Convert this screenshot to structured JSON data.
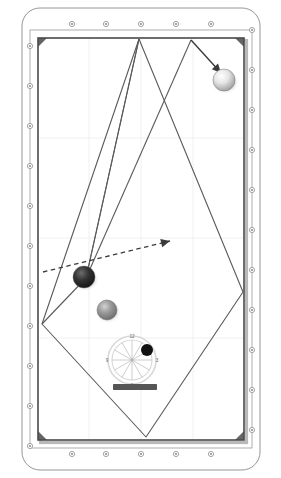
{
  "diagram": {
    "view": "top-down",
    "orientation": "portrait"
  },
  "colors": {
    "table_felt": "#ffffff",
    "rail_fill": "#ffffff",
    "rail_stroke": "#8a8a8a",
    "cushion_stroke": "#4a4a4a",
    "cushion_shadow": "#b9b9b9",
    "grid": "#f0f0f0",
    "trajectory": "#5a5a5a",
    "arrow": "#3b3b3b",
    "ball_object": "#2e2e2e",
    "ball_grey": "#8e8e8e",
    "ball_cue": "#dcdcdc",
    "dial_ring": "#d8d8d8",
    "dial_spoke": "#c8c8c8",
    "dial_dot": "#111111",
    "tip_bar": "#555555",
    "label_text": "#666666"
  },
  "table": {
    "outer_frame": {
      "x": 22,
      "y": 8,
      "width": 238,
      "height": 462,
      "corner_radius": 18
    },
    "playfield": {
      "x": 38,
      "y": 38,
      "width": 206,
      "height": 402
    },
    "rail_width": 16,
    "diamond_marker": {
      "shape": "small-circle",
      "radius": 2.6,
      "stroke": "#9a9a9a"
    },
    "diamonds": {
      "top": [
        {
          "x": 72,
          "y": 24
        },
        {
          "x": 106,
          "y": 24
        },
        {
          "x": 141,
          "y": 24
        },
        {
          "x": 176,
          "y": 24
        },
        {
          "x": 211,
          "y": 24
        }
      ],
      "bottom": [
        {
          "x": 72,
          "y": 454
        },
        {
          "x": 106,
          "y": 454
        },
        {
          "x": 141,
          "y": 454
        },
        {
          "x": 176,
          "y": 454
        },
        {
          "x": 211,
          "y": 454
        }
      ],
      "left": [
        {
          "x": 30,
          "y": 46
        },
        {
          "x": 30,
          "y": 86
        },
        {
          "x": 30,
          "y": 126
        },
        {
          "x": 30,
          "y": 166
        },
        {
          "x": 30,
          "y": 206
        },
        {
          "x": 30,
          "y": 246
        },
        {
          "x": 30,
          "y": 286
        },
        {
          "x": 30,
          "y": 326
        },
        {
          "x": 30,
          "y": 366
        },
        {
          "x": 30,
          "y": 406
        },
        {
          "x": 30,
          "y": 446
        }
      ],
      "right": [
        {
          "x": 252,
          "y": 30
        },
        {
          "x": 252,
          "y": 70
        },
        {
          "x": 252,
          "y": 110
        },
        {
          "x": 252,
          "y": 150
        },
        {
          "x": 252,
          "y": 190
        },
        {
          "x": 252,
          "y": 230
        },
        {
          "x": 252,
          "y": 270
        },
        {
          "x": 252,
          "y": 310
        },
        {
          "x": 252,
          "y": 350
        },
        {
          "x": 252,
          "y": 390
        },
        {
          "x": 252,
          "y": 430
        }
      ]
    },
    "grid_lines": {
      "vertical_x": [
        89,
        141,
        193
      ],
      "horizontal_y": [
        138,
        238,
        338
      ],
      "visible": true
    }
  },
  "balls": [
    {
      "name": "cue-ball",
      "label": "cue",
      "x": 224,
      "y": 80,
      "radius": 11,
      "color": "#dcdcdc",
      "kind": "cue"
    },
    {
      "name": "object-ball",
      "label": "object",
      "x": 84,
      "y": 277,
      "radius": 11,
      "color": "#2e2e2e",
      "kind": "object"
    },
    {
      "name": "secondary-ball",
      "label": "secondary",
      "x": 107,
      "y": 310,
      "radius": 10,
      "color": "#8e8e8e",
      "kind": "target"
    }
  ],
  "trajectories": [
    {
      "name": "path-segment-a",
      "points": [
        [
          139,
          39
        ],
        [
          86,
          278
        ]
      ],
      "style": "solid"
    },
    {
      "name": "path-segment-b",
      "points": [
        [
          86,
          278
        ],
        [
          139,
          39
        ]
      ],
      "style": "solid"
    },
    {
      "name": "kite-outline",
      "points": [
        [
          139,
          39
        ],
        [
          243,
          292
        ],
        [
          146,
          437
        ],
        [
          42,
          324
        ],
        [
          139,
          39
        ]
      ],
      "style": "solid"
    },
    {
      "name": "rebound-line",
      "points": [
        [
          191,
          40
        ],
        [
          86,
          278
        ]
      ],
      "style": "solid"
    },
    {
      "name": "rebound-line-2",
      "points": [
        [
          86,
          278
        ],
        [
          42,
          324
        ]
      ],
      "style": "solid"
    }
  ],
  "arrows": [
    {
      "name": "impact-arrow",
      "style": "solid",
      "from": [
        191,
        40
      ],
      "to": [
        221,
        73
      ],
      "label": "cue ball direction"
    },
    {
      "name": "aim-arrow",
      "style": "dashed",
      "from": [
        43,
        272
      ],
      "to": [
        170,
        241
      ],
      "label": "aim line"
    }
  ],
  "spin_dial": {
    "name": "english-dial",
    "center_x": 132,
    "center_y": 360,
    "outer_radius": 24,
    "inner_radius": 20,
    "spokes": 12,
    "hour_labels": [
      {
        "text": "12",
        "position": "top"
      },
      {
        "text": "3",
        "position": "right"
      },
      {
        "text": "6",
        "position": "bottom"
      },
      {
        "text": "9",
        "position": "left"
      }
    ],
    "contact_dot": {
      "x": 147,
      "y": 350,
      "radius": 6,
      "color": "#111111",
      "meaning": "tip contact point"
    },
    "tip_bar": {
      "x": 113,
      "y": 384,
      "width": 44,
      "height": 6,
      "color": "#555555",
      "label": "cue tip bar"
    }
  }
}
